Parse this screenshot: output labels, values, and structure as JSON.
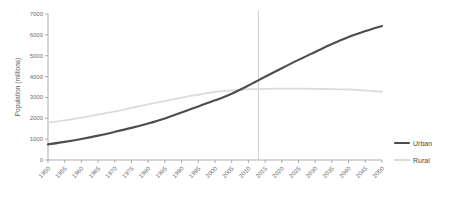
{
  "chart_data": {
    "type": "line",
    "title": "",
    "xlabel": "",
    "ylabel": "Population (millions)",
    "ylim": [
      0,
      7000
    ],
    "xlim": [
      1950,
      2050
    ],
    "yticks": [
      0,
      1000,
      2000,
      3000,
      4000,
      5000,
      6000,
      7000
    ],
    "grid": false,
    "legend_position": "right",
    "x": [
      1950,
      1955,
      1960,
      1965,
      1970,
      1975,
      1980,
      1985,
      1990,
      1995,
      2000,
      2005,
      2010,
      2015,
      2020,
      2025,
      2030,
      2035,
      2040,
      2045,
      2050
    ],
    "categories": [
      "1950",
      "1955",
      "1960",
      "1965",
      "1970",
      "1975",
      "1980",
      "1985",
      "1990",
      "1995",
      "2000",
      "2005",
      "2010",
      "2015",
      "2020",
      "2025",
      "2030",
      "2035",
      "2040",
      "2045",
      "2050"
    ],
    "series": [
      {
        "name": "Urban",
        "color": "#4d4d4d",
        "values": [
          750,
          870,
          1010,
          1170,
          1350,
          1540,
          1750,
          1990,
          2280,
          2570,
          2860,
          3180,
          3570,
          3990,
          4400,
          4800,
          5180,
          5560,
          5900,
          6180,
          6430
        ]
      },
      {
        "name": "Rural",
        "color": "#dcdcdc",
        "values": [
          1790,
          1900,
          2030,
          2180,
          2330,
          2500,
          2670,
          2830,
          2990,
          3130,
          3260,
          3340,
          3390,
          3410,
          3420,
          3420,
          3410,
          3400,
          3380,
          3340,
          3270
        ]
      }
    ],
    "annotations": [
      {
        "type": "vertical-reference-line",
        "x": 2013,
        "color": "#c2c2c2"
      }
    ]
  },
  "legend": {
    "items": [
      {
        "label": "Urban",
        "color": "#4d4d4d"
      },
      {
        "label": "Rural",
        "color": "#dcdcdc"
      }
    ]
  }
}
